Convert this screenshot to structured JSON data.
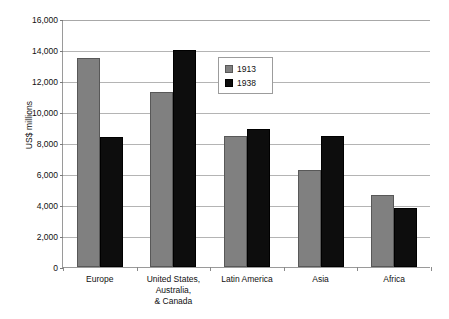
{
  "chart_data": {
    "type": "bar",
    "title": "",
    "xlabel": "",
    "ylabel": "US$ millions",
    "ylim": [
      0,
      16000
    ],
    "ytick_step": 2000,
    "grid": true,
    "legend_position": "inside-upper-center",
    "categories": [
      "Europe",
      "United States,\nAustralia,\n& Canada",
      "Latin America",
      "Asia",
      "Africa"
    ],
    "ytick_labels": [
      "16,000",
      "14,000",
      "12,000",
      "10,000",
      "8,000",
      "6,000",
      "4,000",
      "2,000",
      "0"
    ],
    "ytick_values": [
      16000,
      14000,
      12000,
      10000,
      8000,
      6000,
      4000,
      2000,
      0
    ],
    "series": [
      {
        "name": "1913",
        "color": "#808080",
        "values": [
          13500,
          11300,
          8450,
          6250,
          4650
        ]
      },
      {
        "name": "1938",
        "color": "#0d0d0d",
        "values": [
          8400,
          14000,
          8900,
          8450,
          3800
        ]
      }
    ]
  },
  "legend": {
    "items": [
      {
        "label": "1913",
        "swatch": "gray-swatch"
      },
      {
        "label": "1938",
        "swatch": "black-swatch"
      }
    ]
  }
}
